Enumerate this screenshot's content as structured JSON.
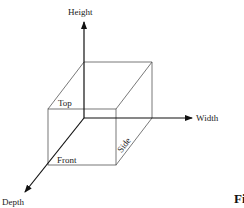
{
  "diagram": {
    "type": "3d-box-axes",
    "axes": {
      "height": {
        "label": "Height",
        "direction": "up"
      },
      "width": {
        "label": "Width",
        "direction": "right"
      },
      "depth": {
        "label": "Depth",
        "direction": "down-left"
      }
    },
    "faces": {
      "top": {
        "label": "Top"
      },
      "front": {
        "label": "Front"
      },
      "side": {
        "label": "Side"
      }
    },
    "caption_fragment": "Fi",
    "colors": {
      "line": "#333333",
      "axis": "#111111",
      "background": "#ffffff"
    }
  }
}
